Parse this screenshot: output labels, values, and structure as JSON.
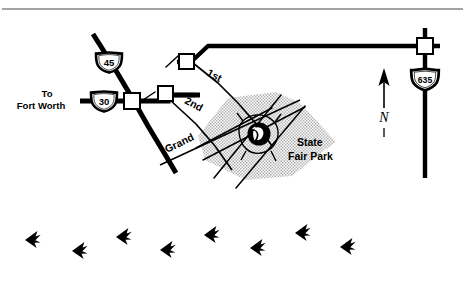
{
  "figure": {
    "type": "locator-map",
    "background_color": "#ffffff",
    "ink_color": "#000000",
    "park_fill_color": "#c8c8c8",
    "top_rule": true
  },
  "destinations": [
    {
      "name": "to-fort-worth",
      "line1": "To",
      "line2": "Fort Worth"
    }
  ],
  "shields": [
    {
      "name": "interstate-45",
      "number": "45",
      "type": "interstate"
    },
    {
      "name": "interstate-30",
      "number": "30",
      "type": "interstate"
    },
    {
      "name": "interstate-635",
      "number": "635",
      "type": "interstate"
    }
  ],
  "street_labels": [
    {
      "name": "first-street",
      "text": "1st"
    },
    {
      "name": "second-street",
      "text": "2nd"
    },
    {
      "name": "grand-avenue",
      "text": "Grand"
    }
  ],
  "places": [
    {
      "name": "state-fair-park",
      "line1": "State",
      "line2": "Fair Park",
      "marker": "ferris-wheel-emblem"
    }
  ],
  "compass": {
    "name": "north-arrow",
    "letter": "N",
    "direction": "up"
  },
  "tracks": {
    "name": "bird-track-trail",
    "symbol": "three-toed-bird-footprint",
    "direction": "left",
    "count": 8,
    "points": [
      {
        "x": 25,
        "y": 240,
        "rot": -8
      },
      {
        "x": 72,
        "y": 251,
        "rot": -8
      },
      {
        "x": 116,
        "y": 237,
        "rot": -8
      },
      {
        "x": 160,
        "y": 250,
        "rot": -8
      },
      {
        "x": 204,
        "y": 235,
        "rot": -8
      },
      {
        "x": 250,
        "y": 248,
        "rot": -8
      },
      {
        "x": 295,
        "y": 233,
        "rot": -8
      },
      {
        "x": 340,
        "y": 247,
        "rot": -8
      }
    ]
  }
}
